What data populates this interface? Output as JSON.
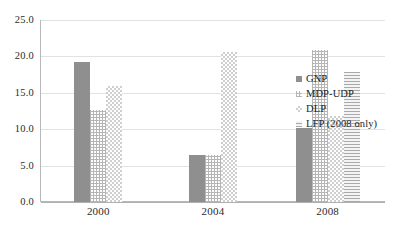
{
  "chart_data": {
    "type": "bar",
    "title": "",
    "subtitle": "",
    "xlabel": "",
    "ylabel": "",
    "categories": [
      "2000",
      "2004",
      "2008"
    ],
    "series": [
      {
        "name": "GNP",
        "values": [
          19.2,
          6.4,
          10.1
        ],
        "color": "#8f8f8f",
        "pattern": "solid-gray"
      },
      {
        "name": "MDP-UDP",
        "values": [
          12.6,
          6.4,
          20.9
        ],
        "color": "#b5b5b5",
        "pattern": "fine-grid"
      },
      {
        "name": "DLP",
        "values": [
          15.9,
          20.6,
          11.8
        ],
        "color": "#cfcfcf",
        "pattern": "checker"
      },
      {
        "name": "LFP (2008 only)",
        "values": [
          null,
          null,
          17.9
        ],
        "color": "#a9a9a9",
        "pattern": "horizontal-lines"
      }
    ],
    "ylim": [
      0.0,
      25.0
    ],
    "ytick_values": [
      25.0,
      20.0,
      15.0,
      10.0,
      5.0,
      0.0
    ],
    "ytick_labels": [
      "25.0",
      "20.0",
      "15.0",
      "10.0",
      "5.0",
      "0.0"
    ],
    "grid": true,
    "grid_axis": "y",
    "legend_position": "right-inside",
    "background": "#ffffff"
  }
}
